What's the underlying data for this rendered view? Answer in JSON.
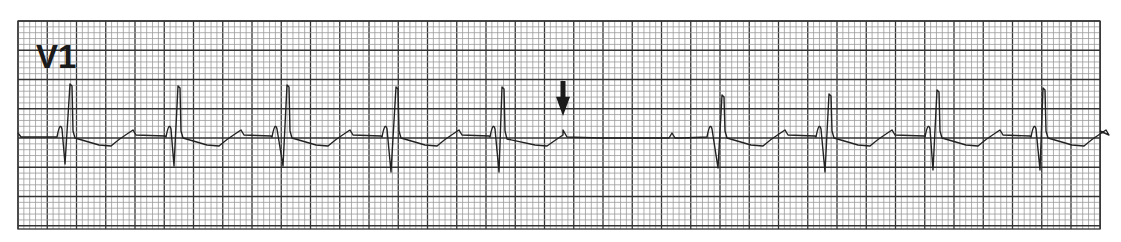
{
  "chart_data": {
    "type": "line",
    "title": "V1",
    "lead": "V1",
    "xlabel": "",
    "ylabel": "",
    "grid": true,
    "legend": null,
    "paper": {
      "left": 18,
      "top": 21,
      "right": 1100,
      "bottom": 229,
      "minor_px": 5.85,
      "major_px": 29.25,
      "minor_color": "#9a9a9a",
      "major_color": "#333333",
      "background": "#ffffff"
    },
    "baseline_y": 137,
    "trace_color": "#222222",
    "beats": [
      {
        "index": 1,
        "p_x": 61,
        "s_x": 65,
        "s_y": 164,
        "r_x": 71,
        "r_y": 84
      },
      {
        "index": 2,
        "p_x": 170,
        "s_x": 174,
        "s_y": 166,
        "r_x": 179,
        "r_y": 86
      },
      {
        "index": 3,
        "p_x": 276,
        "s_x": 283,
        "s_y": 166,
        "r_x": 288,
        "r_y": 85
      },
      {
        "index": 4,
        "p_x": 386,
        "s_x": 391,
        "s_y": 172,
        "r_x": 397,
        "r_y": 87
      },
      {
        "index": 5,
        "p_x": 494,
        "s_x": 499,
        "s_y": 172,
        "r_x": 503,
        "r_y": 87
      },
      {
        "index": 6,
        "p_x": 711,
        "s_x": 718,
        "s_y": 168,
        "r_x": 723,
        "r_y": 95
      },
      {
        "index": 7,
        "p_x": 820,
        "s_x": 825,
        "s_y": 172,
        "r_x": 830,
        "r_y": 94
      },
      {
        "index": 8,
        "p_x": 929,
        "s_x": 933,
        "s_y": 170,
        "r_x": 938,
        "r_y": 90
      },
      {
        "index": 9,
        "p_x": 1035,
        "s_x": 1040,
        "s_y": 170,
        "r_x": 1044,
        "r_y": 88
      }
    ],
    "annotations": [
      {
        "type": "arrow-down",
        "x": 563,
        "y_top": 81,
        "y_tip": 116,
        "label": "premature P wave (non-conducted)",
        "target_x": 563,
        "target_y": 130
      }
    ],
    "pause": {
      "start_x": 570,
      "end_x": 705,
      "small_p_x": 672
    }
  },
  "strip": {
    "lead_label": "V1"
  }
}
